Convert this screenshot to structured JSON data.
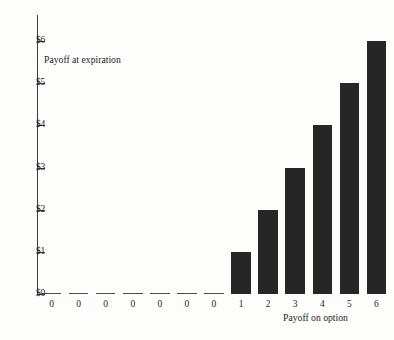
{
  "chart_data": {
    "type": "bar",
    "title": "",
    "subtitle": "",
    "xlabel": "Payoff on option",
    "ylabel": "",
    "annotations": [
      {
        "text": "Payoff at expiration",
        "x": "0.5",
        "y": "5.7"
      }
    ],
    "categories": [
      "0",
      "0",
      "0",
      "0",
      "0",
      "0",
      "0",
      "1",
      "2",
      "3",
      "4",
      "5",
      "6"
    ],
    "values": [
      0,
      0,
      0,
      0,
      0,
      0,
      0,
      1,
      2,
      3,
      4,
      5,
      6
    ],
    "ylim": [
      0,
      6
    ],
    "ytick_values": [
      0,
      1,
      2,
      3,
      4,
      5,
      6
    ],
    "ytick_labels": [
      "$0",
      "$1",
      "$2",
      "$3",
      "$4",
      "$5",
      "$6"
    ],
    "grid": false,
    "legend": null,
    "bar_color": "#262626",
    "axis_color": "#3c3c3c",
    "background_color": "#fdfdfc"
  },
  "figure": {
    "note_label": "Payoff at expiration",
    "x_axis_title": "Payoff on option"
  }
}
